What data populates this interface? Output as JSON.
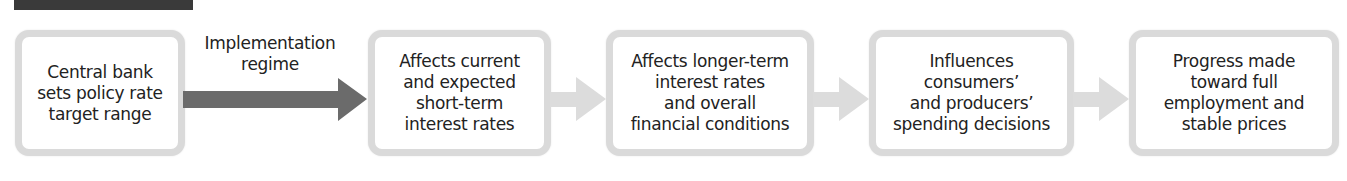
{
  "diagram": {
    "type": "flowchart",
    "direction": "left-to-right",
    "colors": {
      "box_border": "#dadada",
      "primary_arrow": "#6b6b6b",
      "secondary_arrow": "#dcdcdc",
      "top_bar": "#3a3a3a",
      "text": "#222222"
    },
    "steps": [
      {
        "label": "Central bank\nsets policy rate\ntarget range"
      },
      {
        "label": "Affects current\nand expected\nshort-term\ninterest rates"
      },
      {
        "label": "Affects longer-term\ninterest rates\nand overall\nfinancial conditions"
      },
      {
        "label": "Influences\nconsumers’\nand producers’\nspending decisions"
      },
      {
        "label": "Progress made\ntoward full\nemployment and\nstable prices"
      }
    ],
    "connectors": [
      {
        "from": 0,
        "to": 1,
        "label": "Implementation\nregime",
        "style": "dark"
      },
      {
        "from": 1,
        "to": 2,
        "label": "",
        "style": "light"
      },
      {
        "from": 2,
        "to": 3,
        "label": "",
        "style": "light"
      },
      {
        "from": 3,
        "to": 4,
        "label": "",
        "style": "light"
      }
    ]
  }
}
